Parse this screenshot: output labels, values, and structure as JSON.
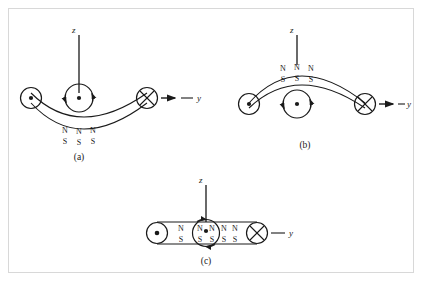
{
  "figure": {
    "border_color": "#d8d8d8",
    "stroke_color": "#1a1a1a",
    "background": "#ffffff"
  },
  "panels": [
    {
      "id": "a",
      "caption": "(a)",
      "shape": "concave-up-arc",
      "axis_z": "z",
      "axis_y": "y",
      "left_symbol": "dot",
      "right_symbol": "cross",
      "center_symbol": "dot",
      "center_circulation": "arrows",
      "pole_rows": [
        {
          "label_row": "N",
          "labels": [
            "N",
            "N",
            "N"
          ]
        },
        {
          "label_row": "S",
          "labels": [
            "S",
            "S",
            "S"
          ]
        }
      ]
    },
    {
      "id": "b",
      "caption": "(b)",
      "shape": "convex-up-arc",
      "axis_z": "z",
      "axis_y": "y",
      "left_symbol": "dot",
      "right_symbol": "cross",
      "center_symbol": "dot",
      "center_circulation": "arrows",
      "pole_rows": [
        {
          "label_row": "N",
          "labels": [
            "N",
            "N",
            "N"
          ]
        },
        {
          "label_row": "S",
          "labels": [
            "S",
            "S",
            "S"
          ]
        }
      ]
    },
    {
      "id": "c",
      "caption": "(c)",
      "shape": "straight-bar",
      "axis_z": "z",
      "axis_y": "y",
      "left_symbol": "dot",
      "right_symbol": "cross",
      "center_symbol": "dot",
      "center_circulation": "arrows",
      "pole_rows": [
        {
          "label_row": "N",
          "labels": [
            "N",
            "N",
            "N",
            "N",
            "N"
          ]
        },
        {
          "label_row": "S",
          "labels": [
            "S",
            "S",
            "S",
            "S",
            "S"
          ]
        }
      ]
    }
  ],
  "symbols": {
    "dot_name": "current-out-of-page",
    "cross_name": "current-into-page",
    "arrow_name": "direction-arrow"
  }
}
